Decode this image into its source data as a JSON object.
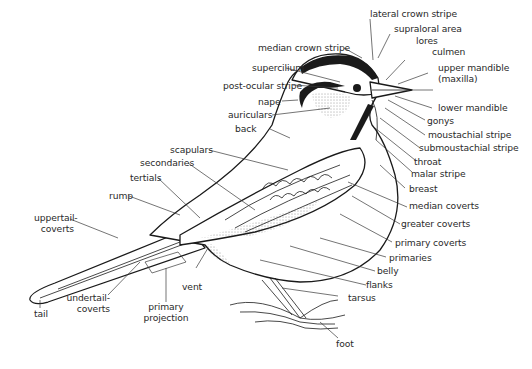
{
  "diagram": {
    "labels": {
      "lateral_crown_stripe": "lateral crown stripe",
      "median_crown_stripe": "median crown stripe",
      "supraloral_area": "supraloral area",
      "supercilium": "supercilium",
      "lores": "lores",
      "culmen": "culmen",
      "post_ocular_stripe": "post-ocular stripe",
      "upper_mandible": "upper mandible",
      "maxilla": "(maxilla)",
      "nape": "nape",
      "auriculars": "auriculars",
      "lower_mandible": "lower mandible",
      "gonys": "gonys",
      "back": "back",
      "moustachial_stripe": "moustachial stripe",
      "submoustachial_stripe": "submoustachial stripe",
      "scapulars": "scapulars",
      "throat": "throat",
      "secondaries": "secondaries",
      "malar_stripe": "malar stripe",
      "tertials": "tertials",
      "breast": "breast",
      "rump": "rump",
      "median_coverts": "median coverts",
      "uppertail_coverts_1": "uppertail-",
      "uppertail_coverts_2": "coverts",
      "greater_coverts": "greater coverts",
      "primary_coverts": "primary coverts",
      "primaries": "primaries",
      "belly": "belly",
      "vent": "vent",
      "flanks": "flanks",
      "undertail_coverts_1": "undertail-",
      "undertail_coverts_2": "coverts",
      "tarsus": "tarsus",
      "tail": "tail",
      "primary_projection_1": "primary",
      "primary_projection_2": "projection",
      "foot": "foot"
    }
  }
}
